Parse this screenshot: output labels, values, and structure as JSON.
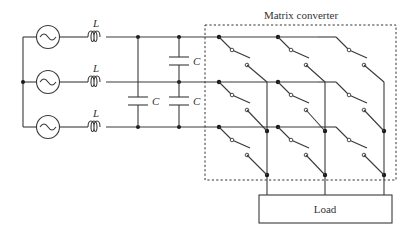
{
  "title": "Matrix converter",
  "load_label": "Load",
  "inductor_label": "L",
  "capacitor_label": "C",
  "sources": [
    {
      "row": 1,
      "y": 37
    },
    {
      "row": 2,
      "y": 82
    },
    {
      "row": 3,
      "y": 127
    }
  ],
  "inductors": [
    "L",
    "L",
    "L"
  ],
  "capacitors": [
    "C",
    "C",
    "C"
  ],
  "switch_matrix": {
    "rows": 3,
    "columns": 3,
    "switch_count": 9
  },
  "colors": {
    "wire": "#3a3a3a",
    "text": "#333333",
    "dashed_box": "#333333"
  }
}
